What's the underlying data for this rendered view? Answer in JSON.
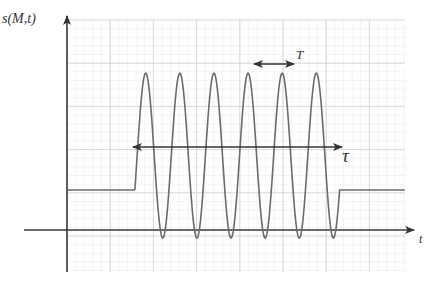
{
  "diagram": {
    "y_axis_label": "s(M,t)",
    "x_axis_label": "t",
    "period_label": "T",
    "duration_label": "τ",
    "signal": {
      "baseline_level": 1,
      "amplitude": 3.5,
      "cycles": 6,
      "start_time": 1.57,
      "duration": 4.7,
      "period": 0.79
    },
    "colors": {
      "curve": "#6b6b6b",
      "axes": "#3a3a3a",
      "grid_major": "#d2d2d2",
      "grid_minor": "#ececec",
      "text": "#333333"
    }
  }
}
